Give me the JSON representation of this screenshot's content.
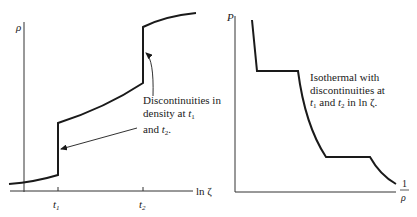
{
  "left_panel": {
    "y_label": "ρ",
    "x_label": "ln ζ",
    "ticks": [
      {
        "name": "t",
        "sub": "1"
      },
      {
        "name": "t",
        "sub": "2"
      }
    ],
    "annotation": {
      "line1": "Discontinuities in",
      "line2_prefix": "density at ",
      "line2_var": "t",
      "line2_sub": "1",
      "line3_prefix": "and ",
      "line3_var": "t",
      "line3_sub": "2",
      "line3_suffix": "."
    }
  },
  "right_panel": {
    "y_label": "P",
    "x_label_num": "1",
    "x_label_den": "ρ",
    "annotation": {
      "line1": "Isothermal with",
      "line2": "discontinuities at",
      "line3_var1": "t",
      "line3_sub1": "1",
      "line3_mid": " and ",
      "line3_var2": "t",
      "line3_sub2": "2",
      "line3_suffix": " in ln ζ."
    }
  },
  "colors": {
    "ink": "#1a1a1a",
    "axis": "#333333",
    "background": "#ffffff"
  }
}
